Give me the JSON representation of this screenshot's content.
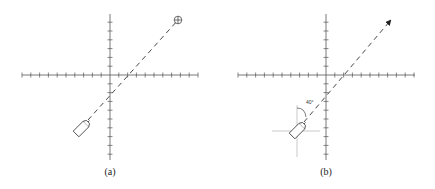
{
  "figure": {
    "panels": [
      {
        "id": "a",
        "label": "(a)",
        "origin": [
          110,
          75
        ],
        "axis_x_range": [
          22,
          198
        ],
        "axis_y_range": [
          14,
          160
        ],
        "tick_spacing": 8.8,
        "boat": {
          "center": [
            81,
            129
          ],
          "heading_deg": 45
        },
        "course_line": {
          "from": [
            88,
            120
          ],
          "to": [
            178,
            20
          ],
          "style": "dashed"
        },
        "target_marker": {
          "type": "crosshair-circle",
          "position": [
            178,
            20
          ]
        }
      },
      {
        "id": "b",
        "label": "(b)",
        "origin": [
          326,
          75
        ],
        "axis_x_range": [
          238,
          415
        ],
        "axis_y_range": [
          14,
          160
        ],
        "tick_spacing": 8.8,
        "boat": {
          "center": [
            297,
            131
          ],
          "heading_deg": 45
        },
        "local_crosshair": {
          "center": [
            297,
            131
          ],
          "x_range": [
            272,
            320
          ],
          "y_range": [
            105,
            157
          ]
        },
        "course_line": {
          "from": [
            304,
            122
          ],
          "to": [
            391,
            20
          ],
          "style": "dashed",
          "end": "arrow"
        },
        "angle_annotation": {
          "text": "40°",
          "position": [
            310,
            100
          ]
        }
      }
    ]
  },
  "colors": {
    "axis": "#555555",
    "crosshair": "#bbbbbb",
    "line": "#333333"
  }
}
